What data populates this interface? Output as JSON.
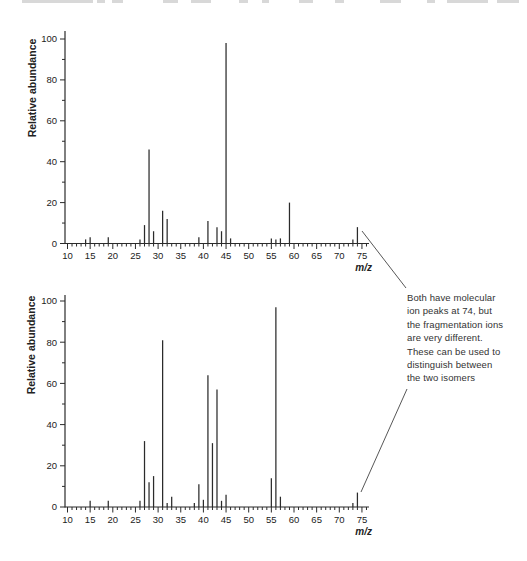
{
  "figure": {
    "kind": "mass-spectrometry-comparison",
    "background": "#ffffff",
    "ink": "#2b2b2b"
  },
  "top_artifact": {
    "color": "#d8d8d8",
    "y": 0,
    "height": 3,
    "segments": [
      [
        22,
        71
      ],
      [
        97,
        8
      ],
      [
        112,
        11
      ],
      [
        163,
        15
      ],
      [
        191,
        20
      ],
      [
        239,
        9
      ],
      [
        262,
        7
      ],
      [
        299,
        14
      ],
      [
        335,
        9
      ],
      [
        380,
        21
      ],
      [
        427,
        8
      ],
      [
        447,
        41
      ],
      [
        497,
        22
      ]
    ]
  },
  "chart_data": [
    {
      "type": "bar",
      "variant": "mass-spectrum-stick",
      "name": "top-spectrum",
      "title": "",
      "xlabel": "m/z",
      "ylabel": "Relative abundance",
      "xlim": [
        10,
        75
      ],
      "ylim": [
        0,
        100
      ],
      "x_major_ticks": [
        10,
        15,
        20,
        25,
        30,
        35,
        40,
        45,
        50,
        55,
        60,
        65,
        70,
        75
      ],
      "y_major_ticks": [
        0,
        20,
        40,
        60,
        80,
        100
      ],
      "x_minor_step": 1,
      "y_minor_step": 10,
      "grid": false,
      "molecular_ion_mz": 74,
      "peaks": [
        [
          14,
          2
        ],
        [
          15,
          3
        ],
        [
          19,
          3
        ],
        [
          26,
          2
        ],
        [
          27,
          9
        ],
        [
          28,
          46
        ],
        [
          29,
          6
        ],
        [
          31,
          16
        ],
        [
          32,
          12
        ],
        [
          39,
          3
        ],
        [
          41,
          11
        ],
        [
          43,
          8
        ],
        [
          44,
          6
        ],
        [
          45,
          98
        ],
        [
          46,
          2.5
        ],
        [
          55,
          2.5
        ],
        [
          56,
          2
        ],
        [
          57,
          2.5
        ],
        [
          59,
          20
        ],
        [
          73,
          2
        ],
        [
          74,
          8
        ]
      ],
      "layout": {
        "x0": 67.5,
        "px_per_x": 4.53,
        "baseline_y": 243.5,
        "px_per_y": 2.045,
        "axis_x": 65,
        "axis_top_y": 31,
        "axis_right_x": 369,
        "tick_label_y": 259,
        "xlabel_x": 372,
        "xlabel_y": 271,
        "ylabel_x": 36,
        "ylabel_y": 88
      }
    },
    {
      "type": "bar",
      "variant": "mass-spectrum-stick",
      "name": "bottom-spectrum",
      "title": "",
      "xlabel": "m/z",
      "ylabel": "Relative abundance",
      "xlim": [
        10,
        75
      ],
      "ylim": [
        0,
        100
      ],
      "x_major_ticks": [
        10,
        15,
        20,
        25,
        30,
        35,
        40,
        45,
        50,
        55,
        60,
        65,
        70,
        75
      ],
      "y_major_ticks": [
        0,
        20,
        40,
        60,
        80,
        100
      ],
      "x_minor_step": 1,
      "y_minor_step": 10,
      "grid": false,
      "molecular_ion_mz": 74,
      "peaks": [
        [
          15,
          3
        ],
        [
          19,
          3
        ],
        [
          26,
          3
        ],
        [
          27,
          32
        ],
        [
          28,
          12
        ],
        [
          29,
          15
        ],
        [
          31,
          81
        ],
        [
          32,
          2
        ],
        [
          33,
          5
        ],
        [
          38,
          2
        ],
        [
          39,
          11
        ],
        [
          40,
          3.5
        ],
        [
          41,
          64
        ],
        [
          42,
          31
        ],
        [
          43,
          57
        ],
        [
          44,
          3
        ],
        [
          45,
          6
        ],
        [
          55,
          14
        ],
        [
          56,
          97
        ],
        [
          57,
          5
        ],
        [
          73,
          2
        ],
        [
          74,
          7
        ]
      ],
      "layout": {
        "x0": 67.5,
        "px_per_x": 4.53,
        "baseline_y": 507,
        "px_per_y": 2.06,
        "axis_x": 65,
        "axis_top_y": 295,
        "axis_right_x": 369,
        "tick_label_y": 523,
        "xlabel_x": 372,
        "xlabel_y": 535,
        "ylabel_x": 35,
        "ylabel_y": 345
      }
    }
  ],
  "annotation": {
    "text": "Both have molecular\nion peaks at 74, but\nthe fragmentation ions\nare very different.\nThese can be used to\ndistinguish between\nthe two isomers",
    "color": "#333333",
    "leader_lines": [
      [
        362,
        231,
        406,
        288
      ],
      [
        407,
        389,
        361,
        492
      ]
    ]
  }
}
